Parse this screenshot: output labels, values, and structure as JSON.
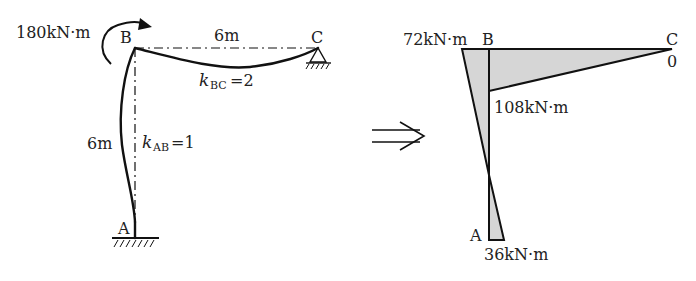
{
  "left_figure": {
    "applied_moment": "180kN·m",
    "node_b": "B",
    "node_c": "C",
    "node_a": "A",
    "span_bc": "6m",
    "span_ab": "6m",
    "stiffness_bc": {
      "k": "k",
      "sub": "BC",
      "value": "=2"
    },
    "stiffness_ab": {
      "k": "k",
      "sub": "AB",
      "value": "=1"
    }
  },
  "arrow": {
    "icon": "implies-arrow"
  },
  "right_figure": {
    "title": "Bending moment diagram",
    "node_b": "B",
    "node_c": "C",
    "node_a": "A",
    "moment_b_column": "72kN·m",
    "moment_b_beam": "108kN·m",
    "moment_c": "0",
    "moment_a": "36kN·m"
  },
  "colors": {
    "line": "#111111",
    "fill": "#d6d6d6"
  }
}
